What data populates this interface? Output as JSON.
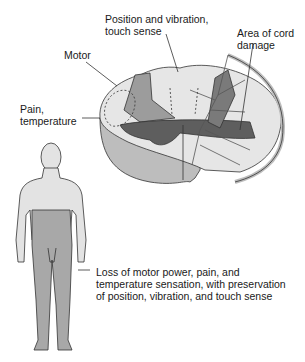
{
  "labels": {
    "position_vibration": "Position and vibration,\ntouch sense",
    "area_cord_damage": "Area of cord\ndamage",
    "motor": "Motor",
    "pain_temperature": "Pain,\ntemperature",
    "loss_description": "Loss of motor power, pain, and\ntemperature sensation, with preservation\nof position, vibration, and touch sense"
  },
  "colors": {
    "background": "#ffffff",
    "cord_white_matter": "#e6e6e6",
    "cord_side_wall": "#bdbdbd",
    "gray_tract": "#9c9c9c",
    "damaged_region": "#5e5e5e",
    "body_unaffected": "#e3e3e3",
    "body_affected": "#a8a8a8",
    "outline": "#333333"
  }
}
